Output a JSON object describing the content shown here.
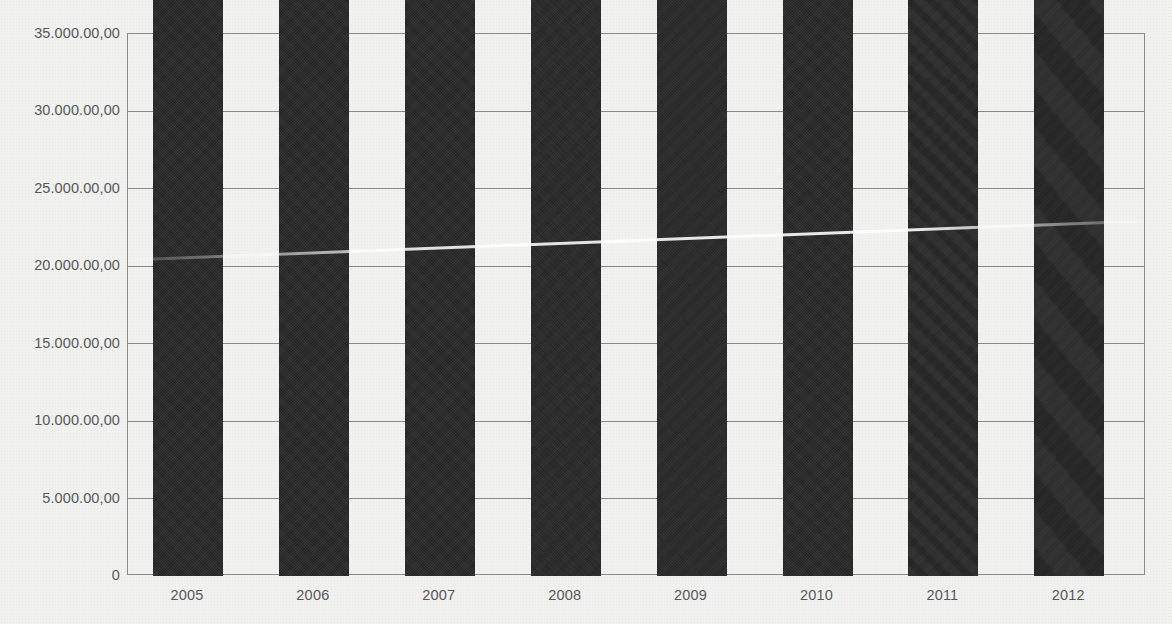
{
  "chart_data": {
    "type": "bar",
    "title": "",
    "subtitle": "",
    "xlabel": "",
    "ylabel": "",
    "categories": [
      "2005",
      "2006",
      "2007",
      "2008",
      "2009",
      "2010",
      "2011",
      "2012"
    ],
    "values": [
      2441041.95,
      7600579.92,
      17530346.45,
      47660885.03,
      83165223.93,
      124103206.1,
      243954000.0,
      287844968.16
    ],
    "value_labels": [
      "2.441.041,95",
      "7.600.579,92",
      "17.530.346,45",
      "47.660.885,03",
      "83.165.223,93",
      "124.103.206,10",
      "243.954.000,00",
      "287.844.968,16"
    ],
    "plotted_values": [
      244104.2,
      760058.0,
      1753034.6,
      4766088.5,
      8316522.4,
      12410320.6,
      24395400.0,
      28784496.8
    ],
    "ylim": [
      0,
      35000
    ],
    "ytick_values": [
      0,
      5000,
      10000,
      15000,
      20000,
      25000,
      30000,
      35000
    ],
    "ytick_labels": [
      "0",
      "5.000.00,00",
      "10.000.00,00",
      "15.000.00,00",
      "20.000.00,00",
      "25.000.00,00",
      "30.000.00,00",
      "35.000.00,00"
    ],
    "grid": true,
    "grid_axis": "y",
    "legend": false,
    "legend_position": "none",
    "series": [
      {
        "name": "",
        "values": [
          2441041.95,
          7600579.92,
          17530346.45,
          47660885.03,
          83165223.93,
          124103206.1,
          243954000.0,
          287844968.16
        ]
      }
    ]
  },
  "colors": {
    "background": "#f1f1ef",
    "bar": "#242424",
    "gridline": "#8a8a88",
    "axis_label": "#58585a",
    "value_label": "#111111"
  }
}
